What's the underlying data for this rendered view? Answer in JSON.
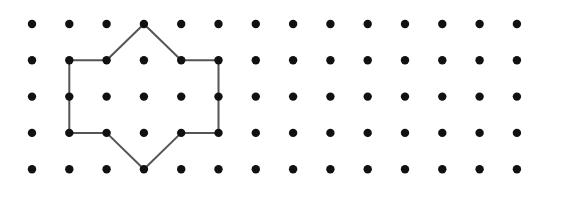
{
  "grid": {
    "columns": 14,
    "rows": 5,
    "origin_x": 32,
    "origin_y": 24,
    "spacing_x": 37.3,
    "spacing_y": 36.3,
    "dot_radius": 4.2,
    "dot_color": "#111111"
  },
  "shape": {
    "stroke_color": "#555555",
    "stroke_width": 2,
    "vertices": [
      [
        3,
        0
      ],
      [
        4,
        1
      ],
      [
        5,
        1
      ],
      [
        5,
        3
      ],
      [
        4,
        3
      ],
      [
        3,
        4
      ],
      [
        2,
        3
      ],
      [
        1,
        3
      ],
      [
        1,
        1
      ],
      [
        2,
        1
      ]
    ]
  }
}
